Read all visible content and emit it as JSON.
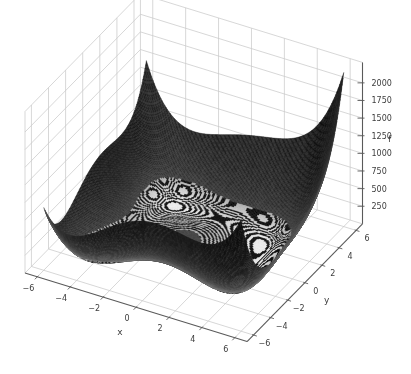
{
  "figure": {
    "kind": "3d-surface-plot",
    "background": "#ffffff"
  },
  "chart_data": {
    "type": "surface",
    "title": "",
    "function": {
      "name": "himmelblau",
      "formula": "(x^2 + y - 11)^2 + (x + y^2 - 7)^2"
    },
    "x_axis": {
      "label": "x",
      "data_range": [
        -6,
        6
      ],
      "tick_values": [
        -6,
        -4,
        -2,
        0,
        2,
        4,
        6
      ],
      "tick_labels": [
        "−6",
        "−4",
        "−2",
        "0",
        "2",
        "4",
        "6"
      ]
    },
    "y_axis": {
      "label": "y",
      "data_range": [
        -6,
        6
      ],
      "tick_values": [
        -6,
        -4,
        -2,
        0,
        2,
        4,
        6
      ],
      "tick_labels": [
        "−6",
        "−4",
        "−2",
        "0",
        "2",
        "4",
        "6"
      ]
    },
    "z_axis": {
      "label": "f",
      "tick_values": [
        250,
        500,
        750,
        1000,
        1250,
        1500,
        1750,
        2000
      ],
      "tick_labels": [
        "250",
        "500",
        "750",
        "1000",
        "1250",
        "1500",
        "1750",
        "2000"
      ],
      "approx_max_value": 2186
    },
    "view": {
      "elevation_deg": 30,
      "azimuth_deg": -60
    },
    "grid": true,
    "minima_locations": [
      [
        3.0,
        2.0
      ],
      [
        -2.805,
        3.131
      ],
      [
        -3.779,
        -3.283
      ],
      [
        3.584,
        -1.848
      ]
    ],
    "local_max": {
      "xy": [
        -0.271,
        -0.923
      ],
      "f": 181.6
    },
    "surface_resolution": 150,
    "rings": {
      "visible_below_f": 160,
      "band_width_f": 5.9
    },
    "colors": {
      "surface_dark": "#0d0d0d",
      "surface_gray": "#3c3c3c",
      "ring_light": "#ececec",
      "ring_dark": "#0e0e0e",
      "grid_line": "#c9c9c9",
      "axis_line": "#5a5a5a",
      "tick_text": "#3c3c3c",
      "background": "#ffffff"
    }
  }
}
